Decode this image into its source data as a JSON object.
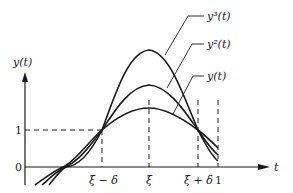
{
  "figure": {
    "axes": {
      "y_label": "y(t)",
      "x_label": "t",
      "y_ticks": [
        {
          "label": "0",
          "value": 0
        },
        {
          "label": "1",
          "value": 1
        }
      ],
      "x_ticks": [
        {
          "label": "ξ − δ",
          "key": "xi_minus_delta"
        },
        {
          "label": "ξ",
          "key": "xi"
        },
        {
          "label": "ξ + δ",
          "key": "xi_plus_delta"
        },
        {
          "label": "1",
          "key": "one"
        }
      ]
    },
    "curves": [
      {
        "id": "y",
        "label": "y(t)"
      },
      {
        "id": "y2",
        "label": "y²(t)"
      },
      {
        "id": "y3",
        "label": "y³(t)"
      }
    ],
    "colors": {
      "ink": "#1a1a1a",
      "background": "#ffffff"
    }
  }
}
